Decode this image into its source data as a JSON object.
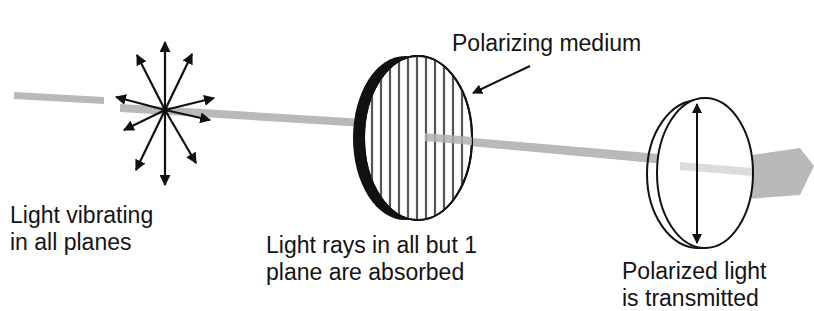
{
  "diagram": {
    "top_caption_fragment": "…, polarizing medium …",
    "labels": {
      "unpolarized": [
        "Light vibrating",
        "in all planes"
      ],
      "medium": "Polarizing medium",
      "absorbed": [
        "Light rays in all but 1",
        "plane are absorbed"
      ],
      "transmitted": [
        "Polarized light",
        "is transmitted"
      ]
    },
    "colors": {
      "beam": "#b8b8b8",
      "ink": "#111111",
      "hatch": "#555555",
      "background": "#ffffff"
    }
  }
}
